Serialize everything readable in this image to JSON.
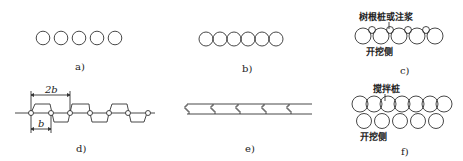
{
  "figure": {
    "panels": [
      {
        "id": "a",
        "caption": "a)",
        "description": "spaced row of 5 circles"
      },
      {
        "id": "b",
        "caption": "b)",
        "description": "tangent row of 6 circles"
      },
      {
        "id": "c",
        "caption": "c)",
        "annotation_top": "树根桩或注浆",
        "annotation_bottom": "开挖侧"
      },
      {
        "id": "d",
        "caption": "d)",
        "dim_top": "2b",
        "dim_bottom": "b"
      },
      {
        "id": "e",
        "caption": "e)",
        "description": "interlocking sheet wall"
      },
      {
        "id": "f",
        "caption": "f)",
        "annotation_top": "搅拌桩",
        "annotation_bottom": "开挖侧"
      }
    ]
  },
  "colors": {
    "line": "#333333",
    "text": "#222222",
    "background": "#ffffff"
  }
}
